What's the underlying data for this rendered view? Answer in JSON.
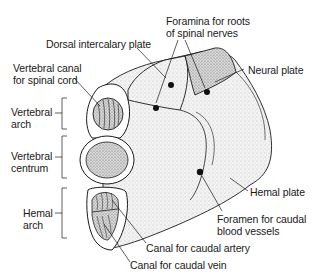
{
  "diagram": {
    "colors": {
      "ink": "#1a1a1a",
      "stipple": "#9a9a9a",
      "background": "#ffffff"
    },
    "labels": {
      "dorsal_intercalary_plate": "Dorsal intercalary plate",
      "foramina_roots": {
        "line1": "Foramina for roots",
        "line2": "of spinal nerves"
      },
      "neural_plate": "Neural plate",
      "vertebral_canal": {
        "line1": "Vertebral canal",
        "line2": "for  spinal cord"
      },
      "vertebral_arch": {
        "line1": "Vertebral",
        "line2": "arch"
      },
      "vertebral_centrum": {
        "line1": "Vertebral",
        "line2": "centrum"
      },
      "hemal_arch": {
        "line1": "Hemal",
        "line2": "arch"
      },
      "hemal_plate": "Hemal plate",
      "foramen_caudal": {
        "line1": "Foramen for caudal",
        "line2": "blood vessels"
      },
      "canal_artery": "Canal for caudal artery",
      "canal_vein": "Canal for caudal vein"
    }
  }
}
